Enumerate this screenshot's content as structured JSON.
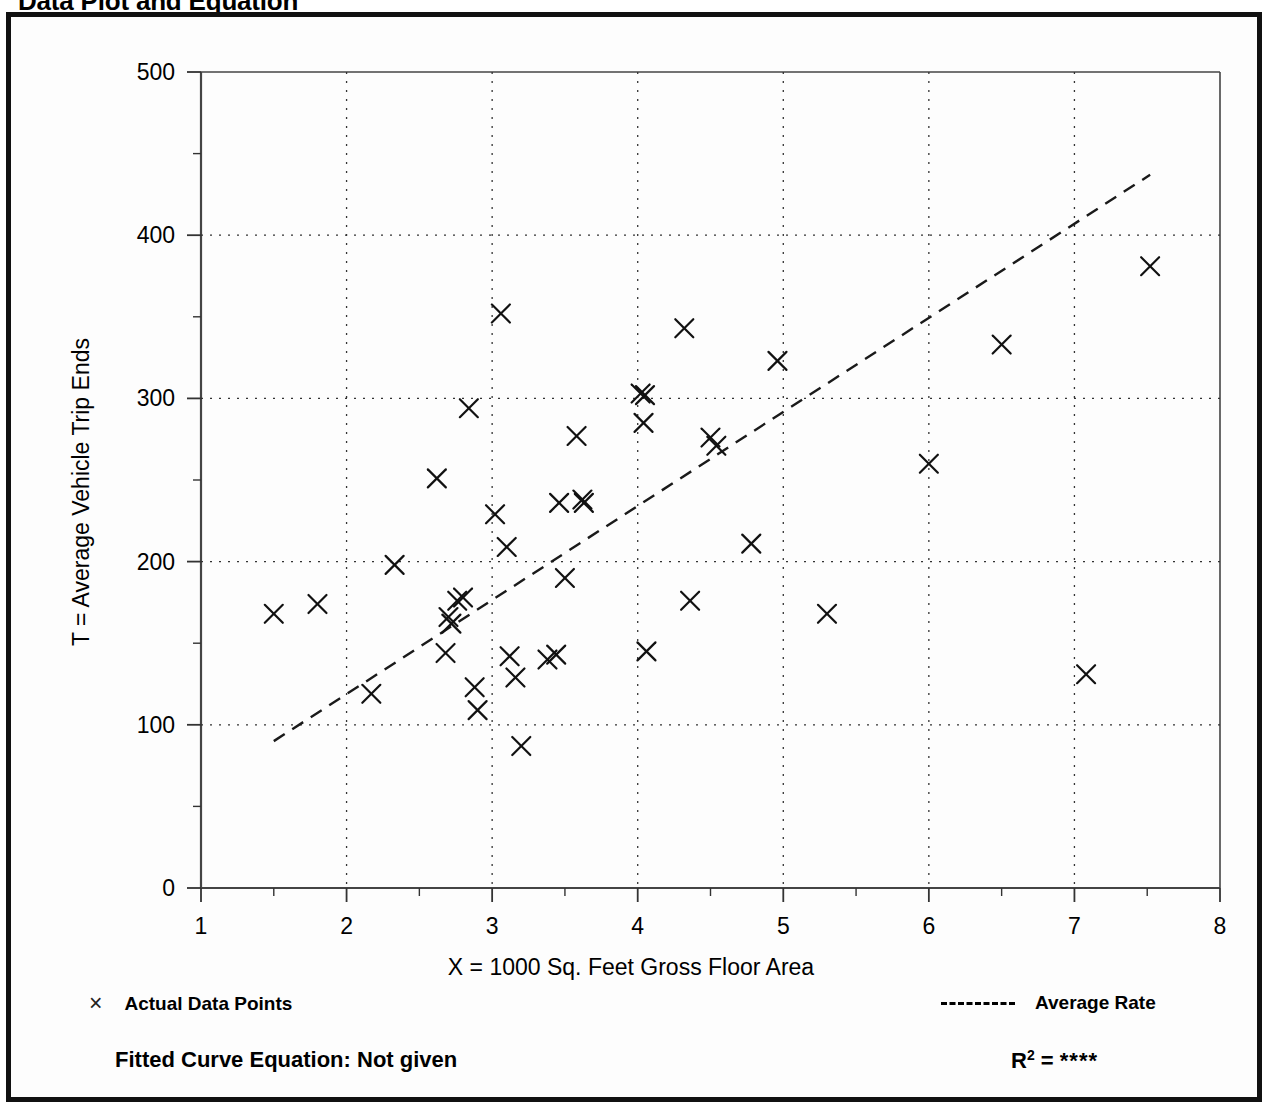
{
  "page": {
    "title": "Data Plot and Equation"
  },
  "legend": {
    "data_points_marker": "×",
    "data_points_label": "Actual Data Points",
    "average_rate_label": "Average Rate"
  },
  "footer": {
    "equation_label": "Fitted Curve Equation:  Not given",
    "r_symbol": "R",
    "r_exponent": "2",
    "r_equals": " = ",
    "r_value": "****"
  },
  "chart_data": {
    "type": "scatter",
    "title": "Data Plot and Equation",
    "xlabel": "X = 1000 Sq. Feet Gross Floor Area",
    "ylabel": "T = Average Vehicle Trip Ends",
    "xlim": [
      1,
      8
    ],
    "ylim": [
      0,
      500
    ],
    "xticks": [
      1,
      2,
      3,
      4,
      5,
      6,
      7,
      8
    ],
    "yticks": [
      0,
      100,
      200,
      300,
      400,
      500
    ],
    "x_minor_step": 0.5,
    "y_minor_step": 50,
    "grid": true,
    "grid_style": "dotted",
    "legend_position": "below-axes",
    "series": [
      {
        "name": "Actual Data Points",
        "marker": "x",
        "points": [
          [
            1.5,
            168
          ],
          [
            1.8,
            174
          ],
          [
            2.17,
            119
          ],
          [
            2.33,
            198
          ],
          [
            2.62,
            251
          ],
          [
            2.68,
            144
          ],
          [
            2.7,
            166
          ],
          [
            2.72,
            162
          ],
          [
            2.76,
            176
          ],
          [
            2.8,
            178
          ],
          [
            2.84,
            294
          ],
          [
            2.88,
            123
          ],
          [
            2.9,
            109
          ],
          [
            3.02,
            229
          ],
          [
            3.06,
            352
          ],
          [
            3.1,
            209
          ],
          [
            3.12,
            142
          ],
          [
            3.16,
            129
          ],
          [
            3.2,
            87
          ],
          [
            3.38,
            140
          ],
          [
            3.44,
            143
          ],
          [
            3.46,
            236
          ],
          [
            3.5,
            190
          ],
          [
            3.58,
            277
          ],
          [
            3.62,
            238
          ],
          [
            3.63,
            236
          ],
          [
            4.02,
            303
          ],
          [
            4.04,
            285
          ],
          [
            4.05,
            302
          ],
          [
            4.06,
            145
          ],
          [
            4.32,
            343
          ],
          [
            4.36,
            176
          ],
          [
            4.5,
            276
          ],
          [
            4.54,
            271
          ],
          [
            4.78,
            211
          ],
          [
            4.96,
            323
          ],
          [
            5.3,
            168
          ],
          [
            6.0,
            260
          ],
          [
            6.5,
            333
          ],
          [
            7.08,
            131
          ],
          [
            7.52,
            381
          ]
        ]
      }
    ],
    "trend_line": {
      "name": "Average Rate",
      "style": "dashed",
      "x_start": 1.5,
      "y_start": 90,
      "x_end": 7.52,
      "y_end": 437
    }
  }
}
